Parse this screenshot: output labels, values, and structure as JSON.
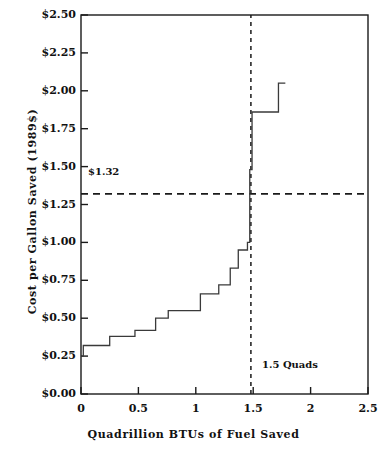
{
  "chart_data": {
    "type": "line",
    "subtype": "step",
    "title": "",
    "xlabel": "Quadrillion BTUs of Fuel Saved",
    "ylabel": "Cost per Gallon Saved (1989$)",
    "xlim": [
      0,
      2.5
    ],
    "ylim": [
      0,
      2.5
    ],
    "xticks": [
      0,
      0.5,
      1,
      1.5,
      2,
      2.5
    ],
    "xtick_labels": [
      "0",
      "0.5",
      "1",
      "1.5",
      "2",
      "2.5"
    ],
    "yticks": [
      0,
      0.25,
      0.5,
      0.75,
      1.0,
      1.25,
      1.5,
      1.75,
      2.0,
      2.25,
      2.5
    ],
    "ytick_labels": [
      "$0.00",
      "$0.25",
      "$0.50",
      "$0.75",
      "$1.00",
      "$1.25",
      "$1.50",
      "$1.75",
      "$2.00",
      "$2.25",
      "$2.50"
    ],
    "grid": false,
    "legend": false,
    "series": [
      {
        "name": "Supply curve of conserved fuel",
        "style": "solid-step",
        "steps": [
          {
            "x_start": 0.0,
            "x_end": 0.02,
            "y": 0.25
          },
          {
            "x_start": 0.02,
            "x_end": 0.25,
            "y": 0.32
          },
          {
            "x_start": 0.25,
            "x_end": 0.47,
            "y": 0.38
          },
          {
            "x_start": 0.47,
            "x_end": 0.65,
            "y": 0.42
          },
          {
            "x_start": 0.65,
            "x_end": 0.76,
            "y": 0.5
          },
          {
            "x_start": 0.76,
            "x_end": 1.04,
            "y": 0.55
          },
          {
            "x_start": 1.04,
            "x_end": 1.2,
            "y": 0.66
          },
          {
            "x_start": 1.2,
            "x_end": 1.3,
            "y": 0.72
          },
          {
            "x_start": 1.3,
            "x_end": 1.37,
            "y": 0.83
          },
          {
            "x_start": 1.37,
            "x_end": 1.45,
            "y": 0.95
          },
          {
            "x_start": 1.45,
            "x_end": 1.47,
            "y": 1.0
          },
          {
            "x_start": 1.47,
            "x_end": 1.49,
            "y": 1.48
          },
          {
            "x_start": 1.49,
            "x_end": 1.72,
            "y": 1.86
          },
          {
            "x_start": 1.72,
            "x_end": 1.78,
            "y": 2.05
          }
        ]
      }
    ],
    "reference_lines": [
      {
        "name": "gasoline-price-threshold",
        "orientation": "horizontal",
        "value": 1.32,
        "style": "dashed",
        "label": "$1.32"
      },
      {
        "name": "quads-target",
        "orientation": "vertical",
        "value": 1.48,
        "style": "dashed",
        "label": "1.5 Quads"
      }
    ],
    "annotations": [
      {
        "text": "$1.32",
        "x": 0.05,
        "y": 1.42
      },
      {
        "text": "1.5 Quads",
        "x": 1.58,
        "y": 0.3
      }
    ],
    "colors": {
      "axis": "#1a1a1a",
      "curve": "#3a3a3a",
      "reference": "#1a1a1a",
      "background": "#ffffff"
    }
  },
  "labels": {
    "x_axis_title": "Quadrillion BTUs of Fuel Saved",
    "y_axis_title": "Cost per Gallon Saved (1989$)",
    "threshold_annotation": "$1.32",
    "quads_annotation": "1.5 Quads"
  }
}
